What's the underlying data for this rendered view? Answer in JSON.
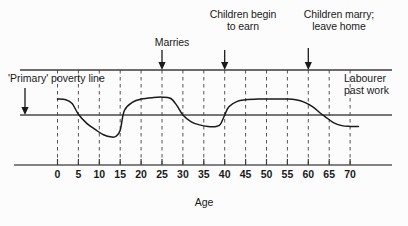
{
  "chart_data": {
    "type": "line",
    "title": "",
    "subtitle": "",
    "xlabel": "Age",
    "ylabel": "",
    "xlim": [
      -3,
      73
    ],
    "ylim": [
      -1.6,
      1.0
    ],
    "grid": true,
    "legend_position": "none",
    "xticks": [
      "0",
      "5",
      "10",
      "15",
      "20",
      "25",
      "30",
      "35",
      "40",
      "45",
      "50",
      "55",
      "60",
      "65",
      "70"
    ],
    "xtick_values": [
      0,
      5,
      10,
      15,
      20,
      25,
      30,
      35,
      40,
      45,
      50,
      55,
      60,
      65,
      70
    ],
    "reference_lines": [
      {
        "name": "primary-poverty-line",
        "orientation": "horizontal",
        "value": 0,
        "label": "'Primary' poverty line"
      },
      {
        "name": "top-border-line",
        "orientation": "horizontal",
        "value": 1.0,
        "label": ""
      },
      {
        "name": "baseline-axis",
        "orientation": "horizontal",
        "value": -1.6,
        "label": ""
      }
    ],
    "series": [
      {
        "name": "Income relative to primary poverty line",
        "x": [
          0,
          2,
          3.5,
          5,
          7,
          9,
          11,
          13,
          14,
          15,
          16,
          18,
          20,
          23,
          25,
          27,
          28.5,
          30,
          32,
          34,
          36,
          38,
          39,
          40,
          41,
          43,
          45,
          48,
          50,
          53,
          55,
          57,
          59,
          61,
          63,
          64,
          66,
          68,
          70,
          72
        ],
        "y": [
          0.42,
          0.4,
          0.3,
          0.02,
          -0.22,
          -0.38,
          -0.52,
          -0.58,
          -0.56,
          -0.4,
          0.12,
          0.34,
          0.42,
          0.46,
          0.47,
          0.44,
          0.26,
          0.0,
          -0.18,
          -0.26,
          -0.3,
          -0.3,
          -0.24,
          0.0,
          0.22,
          0.36,
          0.4,
          0.42,
          0.42,
          0.42,
          0.42,
          0.4,
          0.34,
          0.22,
          0.04,
          -0.04,
          -0.2,
          -0.28,
          -0.3,
          -0.3
        ]
      }
    ],
    "annotations": [
      {
        "name": "marries",
        "text": "Marries",
        "x_value": 25,
        "arrow": "down"
      },
      {
        "name": "children-begin-to-earn",
        "text": "Children begin\nto earn",
        "x_value": 40,
        "arrow": "down"
      },
      {
        "name": "children-marry-leave-home",
        "text": "Children marry;\nleave home",
        "x_value": 60,
        "arrow": "down"
      },
      {
        "name": "primary-poverty-line",
        "text": "'Primary' poverty line",
        "x_value": -2,
        "arrow": "down"
      },
      {
        "name": "labourer-past-work",
        "text": "Labourer\npast work",
        "x_value": 67,
        "arrow": "none"
      }
    ],
    "colors": {
      "curve": "#1a1a1a",
      "axis": "#3d3d3d",
      "gridline": "#555555",
      "text": "#1a1a1a",
      "background": "#fcfcfc"
    }
  }
}
